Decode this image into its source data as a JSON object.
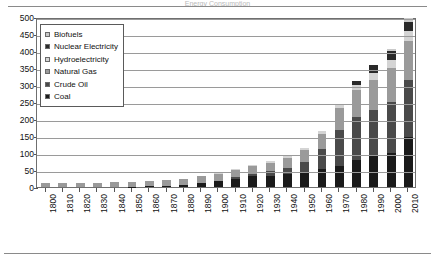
{
  "figure": {
    "cut_off_title": "Energy Consumption",
    "background": "#ffffff"
  },
  "legend": {
    "position": "inside-top-left",
    "items": [
      {
        "label": "Biofuels",
        "color": "#c9c9c9"
      },
      {
        "label": "Nuclear Electricity",
        "color": "#2a2a2a"
      },
      {
        "label": "Hydroelectricity",
        "color": "#d4d4d4"
      },
      {
        "label": "Natural Gas",
        "color": "#9a9a9a"
      },
      {
        "label": "Crude Oil",
        "color": "#4a4a4a"
      },
      {
        "label": "Coal",
        "color": "#1a1a1a"
      }
    ]
  },
  "yaxis": {
    "ticks": [
      "0",
      "50",
      "100",
      "150",
      "200",
      "250",
      "300",
      "350",
      "400",
      "450",
      "500"
    ]
  },
  "chart_data": {
    "type": "bar",
    "subtype": "stacked-vertical",
    "title": "",
    "xlabel": "",
    "ylabel": "",
    "ylim": [
      0,
      500
    ],
    "ystep": 50,
    "grid": true,
    "legend_position": "inside-top-left",
    "categories": [
      "1800",
      "1810",
      "1820",
      "1830",
      "1840",
      "1850",
      "1860",
      "1870",
      "1880",
      "1890",
      "1900",
      "1910",
      "1920",
      "1930",
      "1940",
      "1950",
      "1960",
      "1970",
      "1980",
      "1990",
      "2000",
      "2010"
    ],
    "series": [
      {
        "name": "Coal",
        "color": "#1a1a1a",
        "values": [
          0,
          0,
          0,
          0,
          0,
          1,
          2,
          4,
          7,
          11,
          17,
          25,
          31,
          32,
          37,
          43,
          53,
          63,
          79,
          92,
          99,
          148
        ]
      },
      {
        "name": "Crude Oil",
        "color": "#4a4a4a",
        "values": [
          0,
          0,
          0,
          0,
          0,
          0,
          0,
          0,
          0,
          1,
          2,
          4,
          8,
          15,
          20,
          32,
          60,
          106,
          128,
          136,
          152,
          166
        ]
      },
      {
        "name": "Natural Gas",
        "color": "#9a9a9a",
        "values": [
          12,
          12,
          12,
          13,
          14,
          15,
          16,
          17,
          18,
          19,
          20,
          21,
          23,
          25,
          28,
          33,
          44,
          62,
          77,
          87,
          98,
          116
        ]
      },
      {
        "name": "Hydroelectricity",
        "color": "#d4d4d4",
        "values": [
          0,
          0,
          0,
          0,
          0,
          0,
          0,
          0,
          0,
          0,
          1,
          2,
          3,
          4,
          5,
          6,
          9,
          12,
          15,
          20,
          24,
          29
        ]
      },
      {
        "name": "Nuclear Electricity",
        "color": "#2a2a2a",
        "values": [
          0,
          0,
          0,
          0,
          0,
          0,
          0,
          0,
          0,
          0,
          0,
          0,
          0,
          0,
          0,
          0,
          0,
          2,
          12,
          23,
          26,
          26
        ]
      },
      {
        "name": "Biofuels",
        "color": "#c9c9c9",
        "values": [
          0,
          0,
          0,
          0,
          0,
          0,
          0,
          0,
          0,
          0,
          0,
          0,
          0,
          0,
          0,
          0,
          0,
          0,
          0,
          2,
          6,
          13
        ]
      }
    ],
    "totals": [
      12,
      12,
      12,
      13,
      14,
      16,
      18,
      21,
      25,
      31,
      40,
      52,
      65,
      76,
      90,
      114,
      166,
      245,
      311,
      360,
      405,
      498
    ]
  }
}
